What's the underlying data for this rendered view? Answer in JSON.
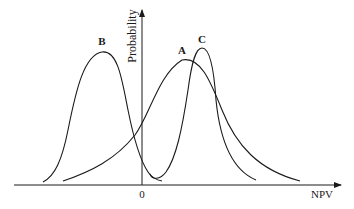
{
  "diagram": {
    "type": "probability-distribution-comparison",
    "axes": {
      "x_label": "NPV",
      "y_label": "Probability",
      "origin_label": "0"
    },
    "curves": [
      {
        "id": "B",
        "label": "B",
        "description": "Narrow distribution centered at negative NPV"
      },
      {
        "id": "A",
        "label": "A",
        "description": "Wide distribution centered at positive NPV"
      },
      {
        "id": "C",
        "label": "C",
        "description": "Narrow tall distribution centered at higher positive NPV"
      }
    ],
    "colors": {
      "line": "#1a1a1a",
      "background": "#ffffff"
    }
  }
}
